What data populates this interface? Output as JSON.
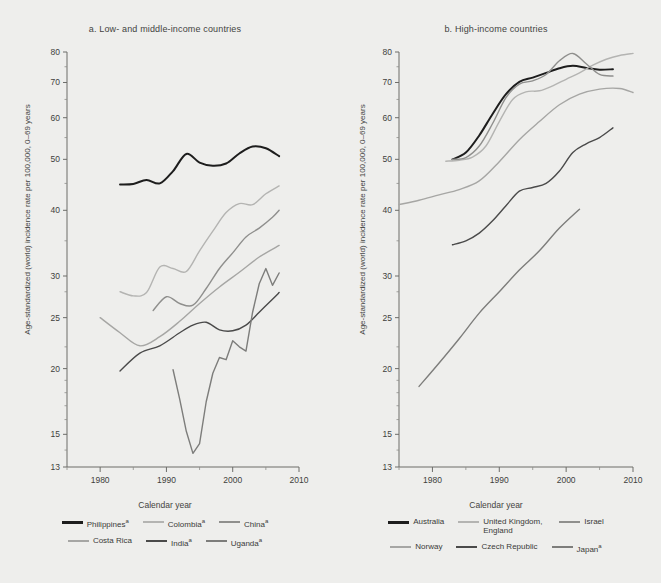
{
  "figure": {
    "background": "#eeeeec",
    "axis_color": "#6d6d69"
  },
  "panels": [
    {
      "id": "a",
      "title": "a. Low- and middle-income countries",
      "xlabel": "Calendar year",
      "ylabel": "Age-standardized (world) incidence rate per 100,000, 0–69 years"
    },
    {
      "id": "b",
      "title": "b. High-income countries",
      "xlabel": "Calendar year",
      "ylabel": "Age-standardized (world) incidence rate per 100,000, 0–69 years"
    }
  ],
  "legend_a": [
    {
      "label": "Philippines",
      "note": "a",
      "color": "#1d1d1d"
    },
    {
      "label": "Colombia",
      "note": "a",
      "color": "#b4b4b2"
    },
    {
      "label": "China",
      "note": "a",
      "color": "#8f8f8d"
    },
    {
      "label": "Costa Rica",
      "note": "",
      "color": "#a6a6a4"
    },
    {
      "label": "India",
      "note": "a",
      "color": "#4a4a4a"
    },
    {
      "label": "Uganda",
      "note": "a",
      "color": "#7d7d7b"
    }
  ],
  "legend_b": [
    {
      "label": "Australia",
      "note": "",
      "color": "#1d1d1d"
    },
    {
      "label": "United Kingdom, England",
      "note": "",
      "color": "#b4b4b2"
    },
    {
      "label": "Israel",
      "note": "",
      "color": "#8f8f8d"
    },
    {
      "label": "Norway",
      "note": "",
      "color": "#a6a6a4"
    },
    {
      "label": "Czech Republic",
      "note": "",
      "color": "#4a4a4a"
    },
    {
      "label": "Japan",
      "note": "a",
      "color": "#7d7d7b"
    }
  ],
  "chart_data": [
    {
      "type": "line",
      "panel": "a",
      "title": "a. Low- and middle-income countries",
      "xlabel": "Calendar year",
      "ylabel": "Age-standardized (world) incidence rate per 100,000, 0-69 years",
      "xlim": [
        1975,
        2010
      ],
      "ylim": [
        13,
        80
      ],
      "yscale": "log",
      "yticks": [
        13,
        15,
        20,
        25,
        30,
        40,
        50,
        60,
        70,
        80
      ],
      "xticks": [
        1980,
        1990,
        2000,
        2010
      ],
      "xticks_minor": [
        1975,
        1985,
        1995,
        2005
      ],
      "grid": false,
      "legend_position": "below",
      "series": [
        {
          "name": "Philippines",
          "note": "a",
          "color": "#1d1d1d",
          "x": [
            1983,
            1985,
            1987,
            1989,
            1991,
            1993,
            1995,
            1997,
            1999,
            2001,
            2003,
            2005,
            2007
          ],
          "y": [
            44.8,
            44.9,
            45.7,
            45.0,
            47.5,
            51.2,
            49.3,
            48.6,
            49.1,
            51.3,
            52.9,
            52.5,
            50.7
          ]
        },
        {
          "name": "Colombia",
          "note": "a",
          "color": "#b4b4b2",
          "x": [
            1983,
            1985,
            1987,
            1989,
            1991,
            1993,
            1995,
            1997,
            1999,
            2001,
            2003,
            2005,
            2007
          ],
          "y": [
            28.0,
            27.5,
            27.9,
            31.2,
            31.0,
            30.6,
            33.5,
            36.5,
            39.6,
            41.2,
            41.0,
            43.0,
            44.5
          ]
        },
        {
          "name": "China",
          "note": "a",
          "color": "#8f8f8d",
          "x": [
            1988,
            1990,
            1992,
            1994,
            1996,
            1998,
            2000,
            2002,
            2004,
            2006,
            2007
          ],
          "y": [
            25.8,
            27.4,
            26.6,
            26.4,
            28.4,
            31.0,
            33.2,
            35.6,
            37.0,
            38.8,
            40.0
          ]
        },
        {
          "name": "Costa Rica",
          "note": "",
          "color": "#a6a6a4",
          "x": [
            1980,
            1983,
            1986,
            1989,
            1992,
            1995,
            1998,
            2001,
            2004,
            2007
          ],
          "y": [
            25.0,
            23.4,
            22.1,
            23.0,
            24.6,
            26.6,
            28.6,
            30.5,
            32.6,
            34.3
          ]
        },
        {
          "name": "India",
          "note": "a",
          "color": "#4a4a4a",
          "x": [
            1983,
            1986,
            1989,
            1992,
            1994,
            1996,
            1998,
            2000,
            2002,
            2004,
            2006,
            2007
          ],
          "y": [
            19.8,
            21.4,
            22.1,
            23.4,
            24.2,
            24.5,
            23.7,
            23.6,
            24.2,
            25.6,
            27.1,
            27.9
          ]
        },
        {
          "name": "Uganda",
          "note": "a",
          "color": "#7d7d7b",
          "x": [
            1991,
            1992,
            1993,
            1994,
            1995,
            1996,
            1997,
            1998,
            1999,
            2000,
            2001,
            2002,
            2003,
            2004,
            2005,
            2006,
            2007
          ],
          "y": [
            19.9,
            17.5,
            15.2,
            13.8,
            14.4,
            17.3,
            19.6,
            21.0,
            20.8,
            22.6,
            22.0,
            21.6,
            25.6,
            29.0,
            31.0,
            28.8,
            30.4
          ]
        }
      ]
    },
    {
      "type": "line",
      "panel": "b",
      "title": "b. High-income countries",
      "xlabel": "Calendar year",
      "ylabel": "Age-standardized (world) incidence rate per 100,000, 0-69 years",
      "xlim": [
        1975,
        2010
      ],
      "ylim": [
        13,
        80
      ],
      "yscale": "log",
      "yticks": [
        13,
        15,
        20,
        25,
        30,
        40,
        50,
        60,
        70,
        80
      ],
      "xticks": [
        1980,
        1990,
        2000,
        2010
      ],
      "xticks_minor": [
        1975,
        1985,
        1995,
        2005
      ],
      "grid": false,
      "legend_position": "below",
      "series": [
        {
          "name": "Australia",
          "note": "",
          "color": "#1d1d1d",
          "x": [
            1983,
            1985,
            1987,
            1989,
            1991,
            1993,
            1995,
            1997,
            1999,
            2001,
            2003,
            2005,
            2007
          ],
          "y": [
            50.0,
            51.5,
            55.5,
            61.0,
            66.5,
            70.2,
            71.5,
            73.0,
            74.5,
            75.3,
            74.6,
            74.0,
            74.2
          ]
        },
        {
          "name": "United Kingdom, England",
          "note": "",
          "color": "#b4b4b2",
          "x": [
            1982,
            1984,
            1986,
            1988,
            1990,
            1992,
            1994,
            1996,
            1998,
            2000,
            2002,
            2004,
            2006,
            2008,
            2010
          ],
          "y": [
            49.6,
            49.8,
            50.5,
            53.0,
            59.0,
            65.0,
            67.2,
            67.5,
            69.0,
            71.0,
            73.0,
            75.5,
            77.5,
            78.8,
            79.5
          ]
        },
        {
          "name": "Israel",
          "note": "",
          "color": "#8f8f8d",
          "x": [
            1983,
            1985,
            1987,
            1989,
            1991,
            1993,
            1995,
            1997,
            1999,
            2001,
            2003,
            2005,
            2007
          ],
          "y": [
            50.0,
            50.4,
            53.0,
            58.5,
            65.5,
            69.5,
            70.5,
            72.5,
            77.0,
            79.5,
            76.0,
            72.5,
            72.0
          ]
        },
        {
          "name": "Norway",
          "note": "",
          "color": "#a6a6a4",
          "x": [
            1975,
            1978,
            1981,
            1984,
            1987,
            1990,
            1993,
            1996,
            1999,
            2002,
            2005,
            2008,
            2010
          ],
          "y": [
            41.0,
            41.8,
            42.8,
            43.8,
            45.5,
            49.5,
            54.5,
            59.0,
            63.5,
            66.5,
            68.0,
            68.2,
            67.0
          ]
        },
        {
          "name": "Czech Republic",
          "note": "",
          "color": "#4a4a4a",
          "x": [
            1983,
            1985,
            1987,
            1989,
            1991,
            1993,
            1995,
            1997,
            1999,
            2001,
            2003,
            2005,
            2007
          ],
          "y": [
            34.4,
            35.0,
            36.2,
            38.2,
            40.8,
            43.5,
            44.2,
            45.0,
            47.5,
            51.5,
            53.5,
            55.0,
            57.4
          ]
        },
        {
          "name": "Japan",
          "note": "a",
          "color": "#7d7d7b",
          "x": [
            1978,
            1981,
            1984,
            1987,
            1990,
            1993,
            1996,
            1999,
            2002
          ],
          "y": [
            18.5,
            20.5,
            22.8,
            25.5,
            28.0,
            30.8,
            33.5,
            37.0,
            40.2
          ]
        }
      ]
    }
  ]
}
